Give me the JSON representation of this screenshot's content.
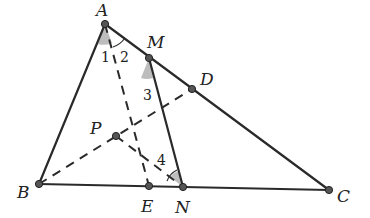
{
  "diagram": {
    "type": "geometry",
    "points": [
      {
        "name": "A",
        "x": 105,
        "y": 24,
        "label_dx": -9,
        "label_dy": -8
      },
      {
        "name": "M",
        "x": 149,
        "y": 58,
        "label_dx": -2,
        "label_dy": -10
      },
      {
        "name": "D",
        "x": 192,
        "y": 89,
        "label_dx": 8,
        "label_dy": -4
      },
      {
        "name": "B",
        "x": 39,
        "y": 184,
        "label_dx": -22,
        "label_dy": 14
      },
      {
        "name": "C",
        "x": 329,
        "y": 190,
        "label_dx": 8,
        "label_dy": 12
      },
      {
        "name": "E",
        "x": 149,
        "y": 186,
        "label_dx": -8,
        "label_dy": 26
      },
      {
        "name": "N",
        "x": 183,
        "y": 187,
        "label_dx": -8,
        "label_dy": 26
      },
      {
        "name": "P",
        "x": 116,
        "y": 136,
        "label_dx": -26,
        "label_dy": -2
      }
    ],
    "solid_segments": [
      [
        "A",
        "B"
      ],
      [
        "A",
        "C"
      ],
      [
        "B",
        "C"
      ],
      [
        "M",
        "N"
      ]
    ],
    "dashed_segments": [
      [
        "A",
        "E"
      ],
      [
        "B",
        "D"
      ],
      [
        "P",
        "N"
      ]
    ],
    "angle_labels": [
      {
        "text": "1",
        "x": 101,
        "y": 62
      },
      {
        "text": "2",
        "x": 120,
        "y": 62
      },
      {
        "text": "3",
        "x": 143,
        "y": 100
      },
      {
        "text": "4",
        "x": 157,
        "y": 165
      }
    ],
    "colors": {
      "stroke": "#2a2a2a",
      "point": "#555555",
      "shade": "#bdbdbd"
    }
  }
}
